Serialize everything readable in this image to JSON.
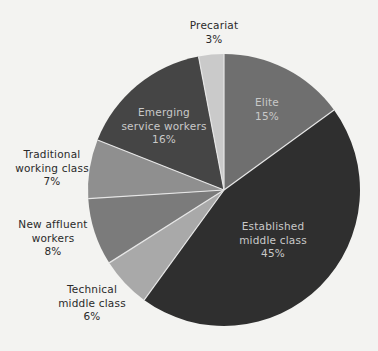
{
  "chart_data": {
    "type": "pie",
    "title": "",
    "center": [
      224,
      190
    ],
    "radius": 136,
    "start_angle_deg": 0,
    "direction": "clockwise",
    "slices": [
      {
        "label": "Elite",
        "value": 15,
        "pct_label": "15%",
        "color": "#6f6f6f"
      },
      {
        "label": "Established middle class",
        "value": 45,
        "pct_label": "45%",
        "color": "#2f2f2f"
      },
      {
        "label": "Technical middle class",
        "value": 6,
        "pct_label": "6%",
        "color": "#a9a9a9"
      },
      {
        "label": "New affluent workers",
        "value": 8,
        "pct_label": "8%",
        "color": "#7b7b7b"
      },
      {
        "label": "Traditional working class",
        "value": 7,
        "pct_label": "7%",
        "color": "#8f8f8f"
      },
      {
        "label": "Emerging service workers",
        "value": 16,
        "pct_label": "16%",
        "color": "#454545"
      },
      {
        "label": "Precariat",
        "value": 3,
        "pct_label": "3%",
        "color": "#cacaca"
      }
    ],
    "separator_color": "#e6e6e6"
  },
  "labels": {
    "elite": {
      "lines": [
        "Elite",
        "15%"
      ]
    },
    "established": {
      "lines": [
        "Established",
        "middle class",
        "45%"
      ]
    },
    "technical": {
      "lines": [
        "Technical",
        "middle class",
        "6%"
      ]
    },
    "new_affluent": {
      "lines": [
        "New affluent",
        "workers",
        "8%"
      ]
    },
    "traditional": {
      "lines": [
        "Traditional",
        "working class",
        "7%"
      ]
    },
    "emerging": {
      "lines": [
        "Emerging",
        "service workers",
        "16%"
      ]
    },
    "precariat": {
      "lines": [
        "Precariat",
        "3%"
      ]
    }
  }
}
